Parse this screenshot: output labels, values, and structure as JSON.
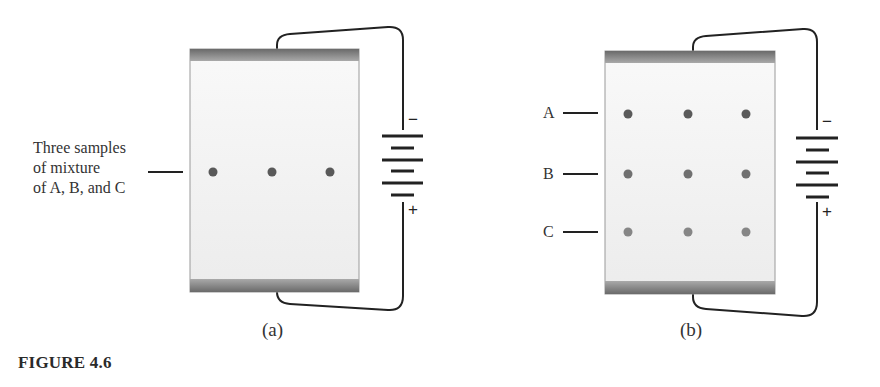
{
  "figure": {
    "caption": "FIGURE 4.6",
    "panels": [
      {
        "id": "a",
        "label": "(a)",
        "annotation": [
          "Three samples",
          "of mixture",
          "of A, B, and C"
        ],
        "dots": [
          {
            "x": 213,
            "y": 172,
            "color": "#595959"
          },
          {
            "x": 272,
            "y": 172,
            "color": "#595959"
          },
          {
            "x": 330,
            "y": 172,
            "color": "#595959"
          }
        ],
        "battery": {
          "minus": "−",
          "plus": "+"
        }
      },
      {
        "id": "b",
        "label": "(b)",
        "row_labels": [
          "A",
          "B",
          "C"
        ],
        "dot_colors": {
          "A": "#5a5a5a",
          "B": "#707070",
          "C": "#868686"
        },
        "battery": {
          "minus": "−",
          "plus": "+"
        }
      }
    ]
  }
}
